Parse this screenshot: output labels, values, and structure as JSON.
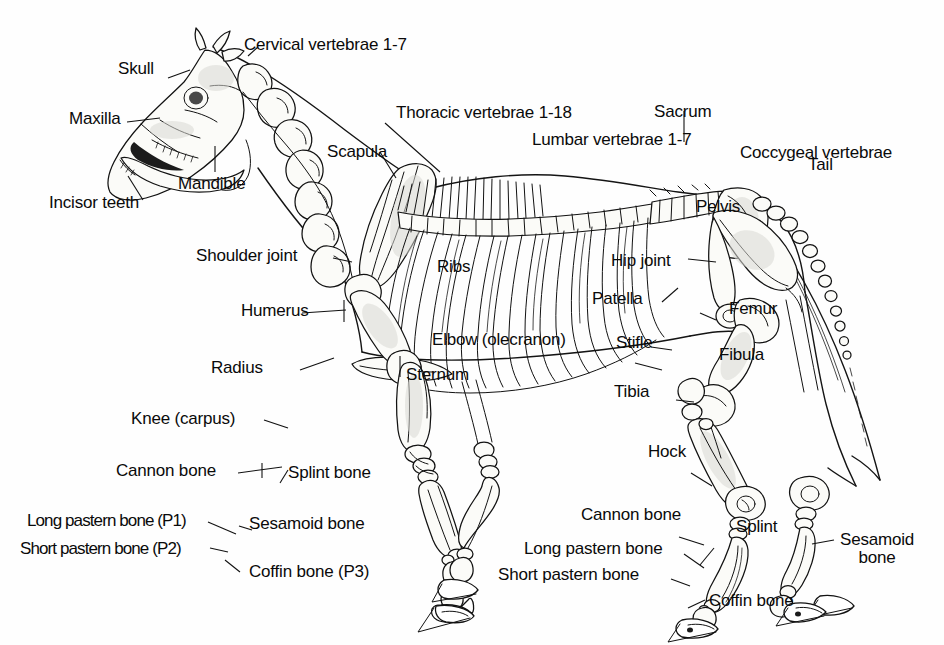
{
  "figure": {
    "background_color": "#fefefe",
    "ink_color": "#111111",
    "credit": "Courtesy of American Assocation of Equine Practitioners/Robin Peterson, D.V.M."
  },
  "labels": {
    "skull": "Skull",
    "cervical_vertebrae": "Cervical vertebrae 1-7",
    "maxilla": "Maxilla",
    "thoracic_vertebrae": "Thoracic vertebrae 1-18",
    "sacrum": "Sacrum",
    "lumbar_vertebrae": "Lumbar vertebrae 1-7",
    "coccygeal_vertebrae": "Coccygeal vertebrae",
    "mandible": "Mandible",
    "scapula": "Scapula",
    "incisor_teeth": "Incisor teeth",
    "tail": "Tail",
    "pelvis": "Pelvis",
    "shoulder_joint": "Shoulder joint",
    "ribs": "Ribs",
    "hip_joint": "Hip joint",
    "humerus": "Humerus",
    "patella": "Patella",
    "femur": "Femur",
    "elbow_olecranon": "Elbow (olecranon)",
    "stifle": "Stifle",
    "fibula": "Fibula",
    "radius": "Radius",
    "sternum": "Sternum",
    "tibia": "Tibia",
    "knee_carpus": "Knee (carpus)",
    "hock": "Hock",
    "cannon_bone_front": "Cannon bone",
    "splint_bone_front": "Splint bone",
    "cannon_bone_hind": "Cannon bone",
    "splint_hind": "Splint",
    "long_pastern_p1": "Long pastern bone (P1)",
    "sesamoid_bone_front": "Sesamoid bone",
    "short_pastern_p2": "Short pastern bone (P2)",
    "long_pastern_hind": "Long pastern bone",
    "short_pastern_hind": "Short pastern bone",
    "sesamoid_bone_hind": "Sesamoid\nbone",
    "sesamoid_bone_hind_line1": "Sesamoid",
    "sesamoid_bone_hind_line2": "bone",
    "coffin_bone_p3": "Coffin bone (P3)",
    "coffin_bone_hind": "Coffin bone"
  }
}
